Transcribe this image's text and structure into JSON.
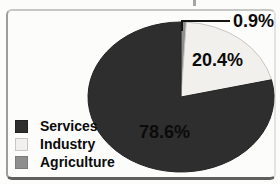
{
  "chart_data": {
    "type": "pie",
    "title": "",
    "unit": "%",
    "slices": [
      {
        "label": "Services",
        "value": 78.6,
        "display": "78.6%",
        "color": "#2e2e2e",
        "stroke": "#232323"
      },
      {
        "label": "Industry",
        "value": 20.4,
        "display": "20.4%",
        "color": "#f1f0ec",
        "stroke": "#c7c6c1"
      },
      {
        "label": "Agriculture",
        "value": 0.9,
        "display": "0.9%",
        "color": "#8e8e8e",
        "stroke": "#7b7b7b"
      }
    ],
    "draw_order_from_top_clockwise": [
      "Agriculture",
      "Industry",
      "Services"
    ],
    "legend_order": [
      "Services",
      "Industry",
      "Agriculture"
    ],
    "legend_position": "bottom-left",
    "callout": {
      "label": "0.9%",
      "target_slice": "Agriculture"
    }
  },
  "colors": {
    "background": "#fcfcfb",
    "frame_border": "#9d9d9b",
    "callout_line": "#141414",
    "text": "#0b0b0b"
  }
}
